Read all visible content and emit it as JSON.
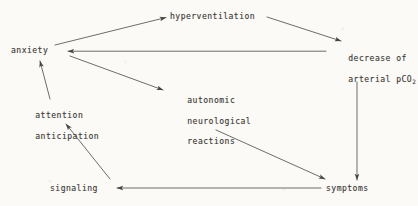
{
  "diagram": {
    "type": "flow-diagram",
    "background_color": "#fbfaf7",
    "ink_color": "#3c3a37",
    "nodes": [
      {
        "id": "anxiety",
        "label": "anxiety"
      },
      {
        "id": "hyperventilation",
        "label": "hyperventilation"
      },
      {
        "id": "decrease",
        "label_line1": "decrease of",
        "label_line2": "arterial pCO",
        "subscript": "2"
      },
      {
        "id": "attention",
        "label_line1": "attention",
        "label_line2": "anticipation"
      },
      {
        "id": "autonomic",
        "label_line1": "autonomic",
        "label_line2": "neurological",
        "label_line3": "reactions"
      },
      {
        "id": "signaling",
        "label": "signaling"
      },
      {
        "id": "symptoms",
        "label": "symptoms"
      }
    ],
    "edges": [
      {
        "from": "anxiety",
        "to": "hyperventilation",
        "name": "anxiety-to-hyperventilation"
      },
      {
        "from": "hyperventilation",
        "to": "decrease",
        "name": "hyperventilation-to-decrease"
      },
      {
        "from": "decrease",
        "to": "anxiety",
        "name": "decrease-to-anxiety"
      },
      {
        "from": "decrease",
        "to": "symptoms",
        "name": "decrease-to-symptoms"
      },
      {
        "from": "anxiety",
        "to": "autonomic",
        "name": "anxiety-to-autonomic"
      },
      {
        "from": "autonomic",
        "to": "symptoms",
        "name": "autonomic-to-symptoms"
      },
      {
        "from": "symptoms",
        "to": "signaling",
        "name": "symptoms-to-signaling"
      },
      {
        "from": "signaling",
        "to": "attention",
        "name": "signaling-to-attention"
      },
      {
        "from": "attention",
        "to": "anxiety",
        "name": "attention-to-anxiety"
      }
    ]
  }
}
